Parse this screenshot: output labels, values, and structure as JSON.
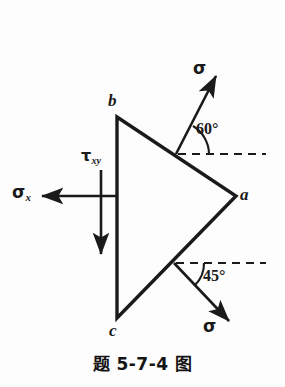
{
  "figure": {
    "caption": "题 5-7-4 图",
    "background_color": "#fdfdfd",
    "ink_color": "#1a1a1a"
  },
  "diagram": {
    "type": "mechanics-stress-element-wedge",
    "shape": {
      "name": "triangular-wedge",
      "vertices": [
        {
          "label": "b",
          "x": 117,
          "y": 117
        },
        {
          "label": "a",
          "x": 236,
          "y": 196
        },
        {
          "label": "c",
          "x": 117,
          "y": 318
        }
      ]
    },
    "vertex_labels": {
      "b": "b",
      "a": "a",
      "c": "c"
    },
    "stresses": [
      {
        "name": "sigma-x",
        "symbol": "σ",
        "subscript": "x",
        "direction": "left",
        "arrow_from": {
          "x": 117,
          "y": 196
        },
        "arrow_to": {
          "x": 38,
          "y": 196
        }
      },
      {
        "name": "tau-xy",
        "symbol": "τ",
        "subscript": "xy",
        "direction": "down",
        "arrow_from": {
          "x": 101,
          "y": 170
        },
        "arrow_to": {
          "x": 101,
          "y": 259
        }
      },
      {
        "name": "sigma-top",
        "symbol": "σ",
        "subscript": "",
        "direction": "up-right",
        "angle_deg": 60,
        "arrow_from": {
          "x": 176,
          "y": 154
        },
        "arrow_to": {
          "x": 219,
          "y": 72
        }
      },
      {
        "name": "sigma-bottom",
        "symbol": "σ",
        "subscript": "",
        "direction": "down-right",
        "angle_deg": 45,
        "arrow_from": {
          "x": 174,
          "y": 263
        },
        "arrow_to": {
          "x": 234,
          "y": 326
        }
      }
    ],
    "angles": [
      {
        "name": "angle-60",
        "value": "60°",
        "reference": "horizontal-dashed-upper"
      },
      {
        "name": "angle-45",
        "value": "45°",
        "reference": "horizontal-dashed-lower"
      }
    ],
    "reference_lines": [
      {
        "name": "dashed-upper",
        "from": {
          "x": 176,
          "y": 154
        },
        "to": {
          "x": 266,
          "y": 154
        },
        "style": "dashed"
      },
      {
        "name": "dashed-lower",
        "from": {
          "x": 174,
          "y": 263
        },
        "to": {
          "x": 266,
          "y": 263
        },
        "style": "dashed"
      }
    ]
  }
}
